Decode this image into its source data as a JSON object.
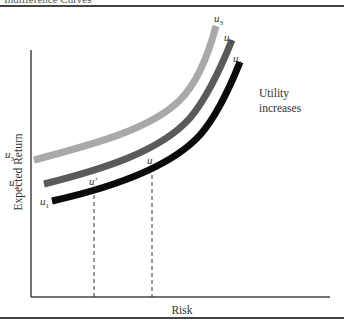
{
  "figure": {
    "header": "Indifference Curves",
    "x_axis_label": "Risk",
    "y_axis_label": "Expected Return",
    "annotation_line1": "Utility",
    "annotation_line2": "increases",
    "curves": [
      {
        "name": "u",
        "sub": "3",
        "color": "#a9a9a9",
        "left_label": "u3",
        "right_label": "u3"
      },
      {
        "name": "u",
        "sub": "2",
        "color": "#5a5a5a",
        "left_label": "u2",
        "right_label": "u2"
      },
      {
        "name": "u",
        "sub": "1",
        "color": "#0a0a0a",
        "left_label": "u1",
        "right_label": "u1"
      }
    ],
    "points": [
      {
        "label": "u′",
        "x_position": "lower risk"
      },
      {
        "label": "u",
        "x_position": "higher risk"
      }
    ]
  }
}
